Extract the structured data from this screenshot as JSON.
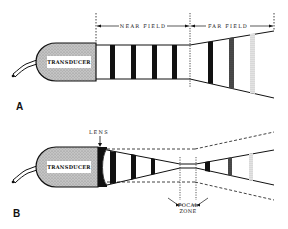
{
  "figure": {
    "panel_a": {
      "label": "A",
      "transducer_label": "TRANSDUCER",
      "near_field_label": "NEAR FIELD",
      "far_field_label": "FAR FIELD"
    },
    "panel_b": {
      "label": "B",
      "transducer_label": "TRANSDUCER",
      "lens_label": "LENS",
      "focal_label_line1": "FOCAL",
      "focal_label_line2": "ZONE"
    }
  },
  "colors": {
    "ink": "#111111",
    "transducer_fill": "#bdbdbd",
    "label_box": "#ffffff",
    "background": "#ffffff"
  }
}
